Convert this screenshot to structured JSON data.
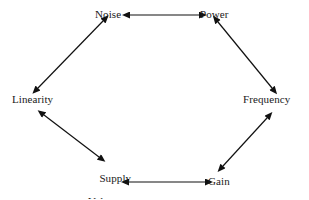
{
  "diagram": {
    "type": "hexagonal-cycle",
    "background_color": "#ffffff",
    "line_color": "#111111",
    "text_color": "#1a1a1a",
    "nodes": [
      {
        "id": "noise",
        "label": "Noise",
        "x": 113,
        "y": 15
      },
      {
        "id": "power",
        "label": "Power",
        "x": 215,
        "y": 15
      },
      {
        "id": "frequency",
        "label": "Frequency",
        "x": 271,
        "y": 100
      },
      {
        "id": "gain",
        "label": "Gain",
        "x": 219,
        "y": 182
      },
      {
        "id": "supply",
        "label_line1": "Supply",
        "label_line2": "Voltage",
        "x": 107,
        "y": 175
      },
      {
        "id": "linearity",
        "label": "Linearity",
        "x": 36,
        "y": 100
      }
    ],
    "edges": [
      {
        "id": "noise-power",
        "from": "noise",
        "to": "power",
        "arrows": "both"
      },
      {
        "id": "power-frequency",
        "from": "power",
        "to": "frequency",
        "arrows": "both"
      },
      {
        "id": "frequency-gain",
        "from": "frequency",
        "to": "gain",
        "arrows": "both"
      },
      {
        "id": "gain-supply",
        "from": "gain",
        "to": "supply",
        "arrows": "both"
      },
      {
        "id": "supply-linearity",
        "from": "supply",
        "to": "linearity",
        "arrows": "both"
      },
      {
        "id": "linearity-noise",
        "from": "linearity",
        "to": "noise",
        "arrows": "both"
      }
    ]
  }
}
